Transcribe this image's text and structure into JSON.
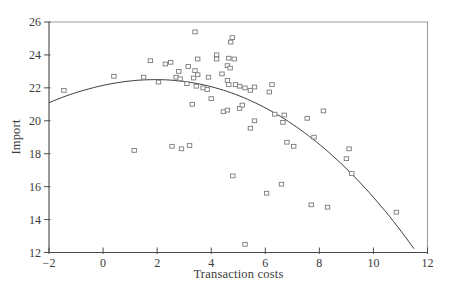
{
  "figure": {
    "bg_color": "#ffffff",
    "frame_color": "#9e9e9e",
    "axis_color": "#474747",
    "tick_color": "#4d4d4d",
    "text_color": "#3a3a3a",
    "marker_color": "#7a7a7a",
    "marker_fill": "#ffffff",
    "curve_color": "#3d3d3d"
  },
  "chart_data": {
    "type": "scatter",
    "title": "",
    "xlabel": "Transaction costs",
    "ylabel": "Import",
    "xlim": [
      -2,
      12
    ],
    "ylim": [
      12,
      26
    ],
    "x_ticks": [
      -2,
      0,
      2,
      4,
      6,
      8,
      10,
      12
    ],
    "y_ticks": [
      12,
      14,
      16,
      18,
      20,
      22,
      24,
      26
    ],
    "grid": false,
    "legend": "none",
    "series": [
      {
        "name": "observations",
        "type": "scatter",
        "marker": "open-square",
        "points": [
          [
            -1.45,
            21.85
          ],
          [
            0.4,
            22.7
          ],
          [
            1.5,
            22.65
          ],
          [
            1.75,
            23.65
          ],
          [
            2.05,
            22.35
          ],
          [
            2.3,
            23.45
          ],
          [
            2.5,
            23.55
          ],
          [
            2.7,
            22.65
          ],
          [
            2.85,
            22.55
          ],
          [
            2.8,
            23.0
          ],
          [
            3.15,
            23.3
          ],
          [
            3.4,
            23.05
          ],
          [
            3.5,
            23.75
          ],
          [
            3.4,
            25.4
          ],
          [
            3.35,
            22.6
          ],
          [
            3.5,
            22.8
          ],
          [
            3.9,
            22.65
          ],
          [
            3.1,
            22.25
          ],
          [
            3.45,
            22.1
          ],
          [
            3.7,
            22.0
          ],
          [
            3.85,
            21.9
          ],
          [
            4.0,
            21.35
          ],
          [
            3.3,
            21.0
          ],
          [
            4.2,
            24.0
          ],
          [
            4.2,
            23.75
          ],
          [
            4.65,
            23.8
          ],
          [
            4.85,
            23.75
          ],
          [
            4.6,
            23.35
          ],
          [
            4.7,
            23.2
          ],
          [
            4.4,
            22.85
          ],
          [
            4.6,
            22.45
          ],
          [
            4.65,
            22.2
          ],
          [
            4.9,
            22.2
          ],
          [
            5.05,
            22.1
          ],
          [
            5.25,
            22.0
          ],
          [
            5.45,
            21.85
          ],
          [
            5.6,
            22.05
          ],
          [
            4.78,
            25.05
          ],
          [
            4.72,
            24.78
          ],
          [
            6.25,
            22.2
          ],
          [
            6.15,
            21.75
          ],
          [
            4.45,
            20.55
          ],
          [
            4.6,
            20.65
          ],
          [
            5.05,
            20.75
          ],
          [
            5.15,
            20.95
          ],
          [
            5.6,
            20.0
          ],
          [
            5.45,
            19.55
          ],
          [
            6.35,
            20.4
          ],
          [
            6.7,
            20.35
          ],
          [
            6.65,
            19.9
          ],
          [
            7.55,
            20.15
          ],
          [
            8.15,
            20.6
          ],
          [
            7.8,
            19.0
          ],
          [
            6.8,
            18.7
          ],
          [
            7.05,
            18.45
          ],
          [
            1.15,
            18.2
          ],
          [
            2.55,
            18.45
          ],
          [
            2.9,
            18.3
          ],
          [
            3.2,
            18.5
          ],
          [
            4.8,
            16.65
          ],
          [
            6.6,
            16.15
          ],
          [
            6.05,
            15.6
          ],
          [
            9.1,
            18.3
          ],
          [
            9.0,
            17.7
          ],
          [
            9.2,
            16.8
          ],
          [
            7.7,
            14.9
          ],
          [
            8.3,
            14.75
          ],
          [
            10.85,
            14.45
          ],
          [
            5.25,
            12.5
          ]
        ]
      },
      {
        "name": "fitted-curve",
        "type": "line",
        "curve": {
          "kind": "cubic-polynomial",
          "coefficients": [
            22.151,
            0.35631,
            -0.08784,
            -0.001578
          ],
          "x_start": -2,
          "x_end": 11.58
        }
      }
    ]
  },
  "layout_px": {
    "plot_left": 49,
    "plot_top": 22,
    "plot_right": 427.5,
    "plot_bottom": 252.5,
    "width": 450,
    "height": 295
  }
}
